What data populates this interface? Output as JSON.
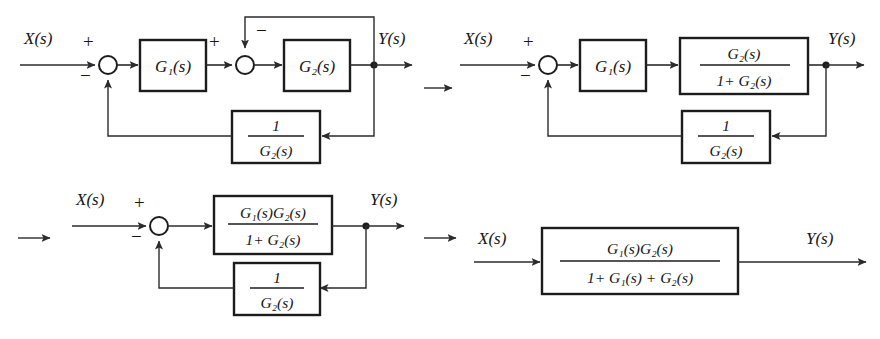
{
  "figure": {
    "background_color": "#ffffff",
    "line_color": "#2b2b2b",
    "step_arrow": "→"
  },
  "labels": {
    "input": "X(s)",
    "output": "Y(s)",
    "plus": "+",
    "minus": "−",
    "one": "1",
    "g1": "G",
    "g2": "G",
    "sub1": "1",
    "sub2": "2",
    "s_arg": "(s)",
    "g1_full": "G₁(s)",
    "g2_full": "G₂(s)",
    "inv_g2_num": "1",
    "inv_g2_den": "G₂(s)",
    "plus_sign": "+"
  },
  "diagrams": [
    {
      "id": "diagram-1",
      "name": "original-block-diagram",
      "position": "top-left",
      "input_label": "X(s)",
      "output_label": "Y(s)",
      "summing_junctions": [
        {
          "name": "outer-summing-junction",
          "signs": [
            "+",
            "−"
          ],
          "feedback_from": "bottom"
        },
        {
          "name": "inner-summing-junction",
          "signs": [
            "+",
            "−"
          ],
          "feedback_from": "top"
        }
      ],
      "blocks": [
        {
          "name": "block-g1",
          "kind": "simple",
          "text": "G₁(s)"
        },
        {
          "name": "block-g2",
          "kind": "simple",
          "text": "G₂(s)"
        },
        {
          "name": "block-inverse-g2",
          "kind": "fraction",
          "numerator": "1",
          "denominator": "G₂(s)"
        }
      ]
    },
    {
      "id": "diagram-2",
      "name": "inner-loop-collapsed-diagram",
      "position": "top-right",
      "input_label": "X(s)",
      "output_label": "Y(s)",
      "summing_junctions": [
        {
          "name": "outer-summing-junction",
          "signs": [
            "+",
            "−"
          ],
          "feedback_from": "bottom"
        }
      ],
      "blocks": [
        {
          "name": "block-g1",
          "kind": "simple",
          "text": "G₁(s)"
        },
        {
          "name": "block-g2-over-one-plus-g2",
          "kind": "fraction",
          "numerator": "G₂(s)",
          "denominator": "1+ G₂(s)"
        },
        {
          "name": "block-inverse-g2",
          "kind": "fraction",
          "numerator": "1",
          "denominator": "G₂(s)"
        }
      ]
    },
    {
      "id": "diagram-3",
      "name": "forward-path-merged-diagram",
      "position": "bottom-left",
      "input_label": "X(s)",
      "output_label": "Y(s)",
      "summing_junctions": [
        {
          "name": "outer-summing-junction",
          "signs": [
            "+",
            "−"
          ],
          "feedback_from": "bottom"
        }
      ],
      "blocks": [
        {
          "name": "block-forward-path",
          "kind": "fraction",
          "numerator": "G₁(s)G₂(s)",
          "denominator": "1+ G₂(s)"
        },
        {
          "name": "block-inverse-g2",
          "kind": "fraction",
          "numerator": "1",
          "denominator": "G₂(s)"
        }
      ]
    },
    {
      "id": "diagram-4",
      "name": "final-transfer-function-diagram",
      "position": "bottom-right",
      "input_label": "X(s)",
      "output_label": "Y(s)",
      "summing_junctions": [],
      "blocks": [
        {
          "name": "block-closed-loop-transfer-function",
          "kind": "fraction",
          "numerator": "G₁(s)G₂(s)",
          "denominator": "1+ G₁(s) + G₂(s)"
        }
      ]
    }
  ],
  "step_arrows": [
    {
      "name": "step-arrow-1",
      "glyph": "→",
      "between": [
        "diagram-1",
        "diagram-2"
      ]
    },
    {
      "name": "step-arrow-2",
      "glyph": "→",
      "between": [
        "diagram-2",
        "diagram-3"
      ]
    },
    {
      "name": "step-arrow-3",
      "glyph": "→",
      "between": [
        "diagram-3",
        "diagram-4"
      ]
    }
  ]
}
